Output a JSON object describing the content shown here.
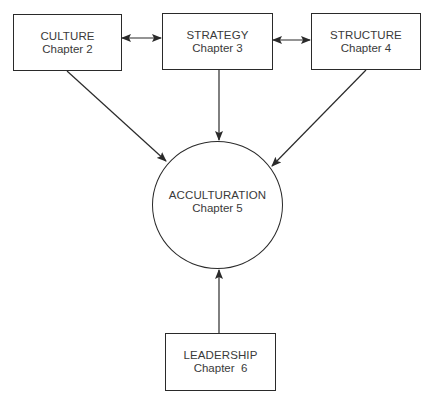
{
  "diagram": {
    "nodes": [
      {
        "id": "culture",
        "title": "CULTURE",
        "subtitle": "Chapter 2",
        "shape": "rectangle"
      },
      {
        "id": "strategy",
        "title": "STRATEGY",
        "subtitle": "Chapter 3",
        "shape": "rectangle"
      },
      {
        "id": "structure",
        "title": "STRUCTURE",
        "subtitle": "Chapter 4",
        "shape": "rectangle"
      },
      {
        "id": "acculturation",
        "title": "ACCULTURATION",
        "subtitle": "Chapter 5",
        "shape": "circle"
      },
      {
        "id": "leadership",
        "title": "LEADERSHIP",
        "subtitle": "Chapter  6",
        "shape": "rectangle"
      }
    ],
    "edges": [
      {
        "from": "culture",
        "to": "strategy",
        "type": "bidirectional"
      },
      {
        "from": "strategy",
        "to": "structure",
        "type": "bidirectional"
      },
      {
        "from": "culture",
        "to": "acculturation",
        "type": "directed"
      },
      {
        "from": "strategy",
        "to": "acculturation",
        "type": "directed"
      },
      {
        "from": "structure",
        "to": "acculturation",
        "type": "directed"
      },
      {
        "from": "leadership",
        "to": "acculturation",
        "type": "directed"
      }
    ],
    "colors": {
      "line": "#2a2a2a",
      "text": "#3a3a3a",
      "background": "#ffffff"
    }
  }
}
